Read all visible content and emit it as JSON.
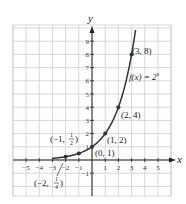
{
  "chart_data": {
    "type": "line",
    "title": "",
    "function_label": "f(x) = 2^x",
    "xlabel": "x",
    "ylabel": "y",
    "xlim": [
      -6,
      6
    ],
    "ylim": [
      -2.7,
      10.2
    ],
    "grid": true,
    "x_ticks": [
      -5,
      -4,
      -3,
      -2,
      -1,
      1,
      2,
      3,
      4,
      5
    ],
    "y_ticks": [
      -1,
      1,
      2,
      3,
      4,
      5,
      6,
      7,
      8,
      9
    ],
    "series": [
      {
        "name": "f(x) = 2^x",
        "x": [
          -3,
          -2,
          -1,
          0,
          1,
          2,
          3,
          3.3
        ],
        "y": [
          0.125,
          0.25,
          0.5,
          1,
          2,
          4,
          8,
          9.85
        ]
      }
    ],
    "points": [
      {
        "x": -2,
        "y": 0.25,
        "label": "(−2, 1/4)"
      },
      {
        "x": -1,
        "y": 0.5,
        "label": "(−1, 1/2)"
      },
      {
        "x": 0,
        "y": 1,
        "label": "(0, 1)"
      },
      {
        "x": 1,
        "y": 2,
        "label": "(1, 2)"
      },
      {
        "x": 2,
        "y": 4,
        "label": "(2, 4)"
      },
      {
        "x": 3,
        "y": 8,
        "label": "(3, 8)"
      }
    ]
  },
  "labels": {
    "y_axis": "y",
    "x_axis": "x",
    "func": "f(x) = 2",
    "func_exp": "x",
    "p38": "(3, 8)",
    "p24": "(2, 4)",
    "p12": "(1, 2)",
    "p01": "(0, 1)",
    "pm1_open": "(−1, ",
    "pm1_num": "1",
    "pm1_den": "2",
    "pm2_open": "(−2, ",
    "pm2_num": "1",
    "pm2_den": "4",
    "close": ")"
  }
}
